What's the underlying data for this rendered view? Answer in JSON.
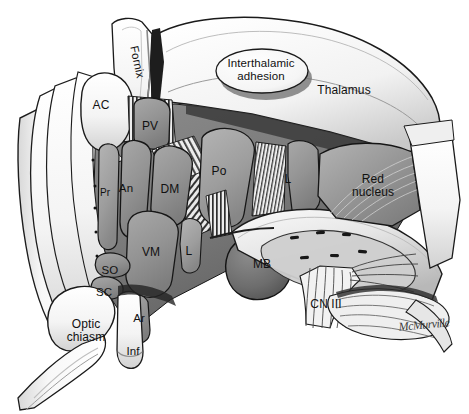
{
  "figure": {
    "signature": "McMurville",
    "background_color": "#ffffff",
    "outline_color": "#1a1a1a"
  },
  "palette": {
    "white_structure": "#fbfbfb",
    "light_gray": "#e2e2e2",
    "mid_gray": "#9a9a9a",
    "nucleus_gray": "#8e8e8e",
    "dark_gray": "#6a6a6a",
    "darker_gray": "#4d4d4d",
    "shadow": "#2a2a2a",
    "outline": "#1a1a1a"
  },
  "labels": [
    {
      "id": "fornix",
      "text": "Fornix",
      "x": 137,
      "y": 62,
      "size": "md",
      "rotated": true,
      "tone": "white_structure"
    },
    {
      "id": "ac",
      "text": "AC",
      "x": 101,
      "y": 106,
      "size": "lg",
      "rotated": false,
      "tone": "white_structure"
    },
    {
      "id": "interthalamic",
      "text": "Interthalamic\nadhesion",
      "x": 261,
      "y": 70,
      "size": "md",
      "rotated": false,
      "tone": "white_structure"
    },
    {
      "id": "thalamus",
      "text": "Thalamus",
      "x": 344,
      "y": 91,
      "size": "lg",
      "rotated": false,
      "tone": "white_structure"
    },
    {
      "id": "pv",
      "text": "PV",
      "x": 150,
      "y": 127,
      "size": "lg",
      "rotated": false,
      "tone": "nucleus_gray"
    },
    {
      "id": "pr",
      "text": "Pr",
      "x": 105,
      "y": 193,
      "size": "sm",
      "rotated": false,
      "tone": "nucleus_gray"
    },
    {
      "id": "an",
      "text": "An",
      "x": 126,
      "y": 188,
      "size": "md",
      "rotated": false,
      "tone": "nucleus_gray"
    },
    {
      "id": "dm",
      "text": "DM",
      "x": 170,
      "y": 190,
      "size": "lg",
      "rotated": false,
      "tone": "nucleus_gray"
    },
    {
      "id": "po",
      "text": "Po",
      "x": 219,
      "y": 172,
      "size": "lg",
      "rotated": false,
      "tone": "nucleus_gray"
    },
    {
      "id": "l-upper",
      "text": "L",
      "x": 288,
      "y": 180,
      "size": "lg",
      "rotated": false,
      "tone": "nucleus_gray"
    },
    {
      "id": "red-nucleus",
      "text": "Red\nnucleus",
      "x": 373,
      "y": 186,
      "size": "lg",
      "rotated": false,
      "tone": "mid_gray"
    },
    {
      "id": "vm",
      "text": "VM",
      "x": 151,
      "y": 253,
      "size": "lg",
      "rotated": false,
      "tone": "nucleus_gray"
    },
    {
      "id": "l-lower",
      "text": "L",
      "x": 189,
      "y": 252,
      "size": "lg",
      "rotated": false,
      "tone": "nucleus_gray"
    },
    {
      "id": "mb",
      "text": "MB",
      "x": 262,
      "y": 265,
      "size": "lg",
      "rotated": false,
      "tone": "dark_gray"
    },
    {
      "id": "so",
      "text": "SO",
      "x": 110,
      "y": 270,
      "size": "md",
      "rotated": false,
      "tone": "nucleus_gray"
    },
    {
      "id": "sc",
      "text": "SC",
      "x": 104,
      "y": 292,
      "size": "md",
      "rotated": false,
      "tone": "nucleus_gray"
    },
    {
      "id": "ar",
      "text": "Ar",
      "x": 139,
      "y": 318,
      "size": "md",
      "rotated": false,
      "tone": "nucleus_gray"
    },
    {
      "id": "inf",
      "text": "Inf",
      "x": 133,
      "y": 351,
      "size": "md",
      "rotated": false,
      "tone": "white_structure"
    },
    {
      "id": "optic-chiasm",
      "text": "Optic\nchiasm",
      "x": 86,
      "y": 331,
      "size": "lg",
      "rotated": false,
      "tone": "white_structure"
    },
    {
      "id": "cn3",
      "text": "CN III",
      "x": 326,
      "y": 305,
      "size": "lg",
      "rotated": false,
      "tone": "white_structure"
    }
  ],
  "structures": {
    "thalamus": "Thalamus",
    "interthalamic_adhesion": "Interthalamic adhesion",
    "fornix": "Fornix",
    "anterior_commissure": "AC",
    "paraventricular_nucleus": "PV",
    "preoptic_nucleus": "Pr",
    "anterior_nucleus": "An",
    "dorsomedial_nucleus": "DM",
    "posterior_nucleus": "Po",
    "lateral_nucleus": "L",
    "ventromedial_nucleus": "VM",
    "mammillary_body": "MB",
    "supraoptic_nucleus": "SO",
    "suprachiasmatic_nucleus": "SC",
    "arcuate_nucleus": "Ar",
    "infundibulum": "Inf",
    "optic_chiasm": "Optic chiasm",
    "red_nucleus": "Red nucleus",
    "oculomotor_nerve": "CN III"
  }
}
